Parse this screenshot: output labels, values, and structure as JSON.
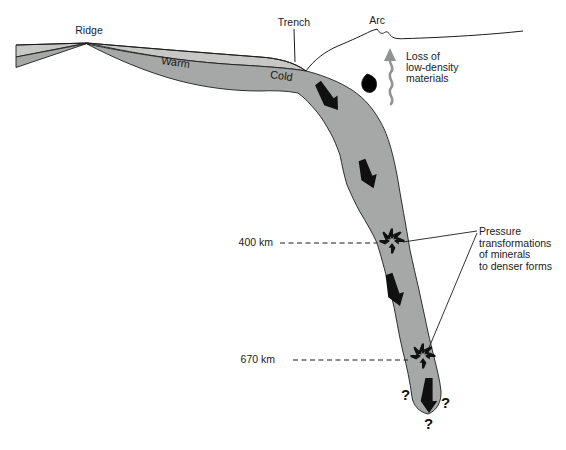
{
  "labels": {
    "ridge": "Ridge",
    "trench": "Trench",
    "arc": "Arc",
    "warm": "Warm",
    "cold": "Cold",
    "loss_of_low_density_materials": [
      "Loss of",
      "low-density",
      "materials"
    ],
    "pressure_transformations": [
      "Pressure",
      "transformations",
      "of minerals",
      "to denser forms"
    ],
    "depth_400": "400 km",
    "depth_670": "670 km"
  },
  "question_marks": [
    "?",
    "?",
    "?"
  ],
  "colors": {
    "background": "#ffffff",
    "plate_light_gray": "#c7c8c6",
    "slab_gray": "#a5a8a6",
    "outline_black": "#1c1c1c",
    "arrow_black": "#101010",
    "rising_arrow_gray": "#8f9391",
    "blob_dark": "#47494 8"
  }
}
